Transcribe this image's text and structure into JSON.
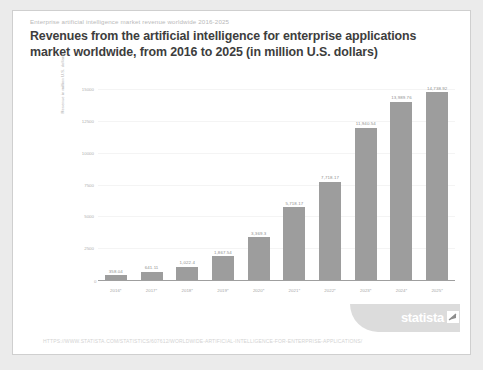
{
  "header": {
    "eyebrow": "Enterprise artificial intelligence market revenue worldwide 2016-2025",
    "title": "Revenues from the artificial intelligence for enterprise applications market worldwide, from 2016 to 2025 (in million U.S. dollars)"
  },
  "footer": {
    "url": "HTTPS://WWW.STATISTA.COM/STATISTICS/607612/WORLDWIDE-ARTIFICIAL-INTELLIGENCE-FOR-ENTERPRISE-APPLICATIONS/",
    "brand": "statista"
  },
  "colors": {
    "bar": "#9d9d9d",
    "card": "#ffffff",
    "page": "#ebebeb",
    "axis": "#9f9f9f",
    "grid": "#f4f4f4",
    "title_text": "#3d3d3d",
    "muted_text": "#b0b0b0"
  },
  "chart_data": {
    "type": "bar",
    "title": "Revenues from the artificial intelligence for enterprise applications market worldwide, from 2016 to 2025 (in million U.S. dollars)",
    "xlabel": "",
    "ylabel": "Revenue in million U.S. dollars",
    "categories": [
      "2016*",
      "2017*",
      "2018*",
      "2019*",
      "2020*",
      "2021*",
      "2022*",
      "2023*",
      "2024*",
      "2025*"
    ],
    "values": [
      358.04,
      641.11,
      1022.4,
      1867.54,
      3369.3,
      5718.17,
      7718.17,
      11940.54,
      13989.76,
      14738.92
    ],
    "value_labels": [
      "358.04",
      "641.11",
      "1,022.4",
      "1,867.54",
      "3,369.3",
      "5,718.17",
      "7,718.17",
      "11,940.54",
      "13,989.76",
      "14,738.92"
    ],
    "ylim": [
      0,
      15000
    ],
    "yticks": [
      0,
      2500,
      5000,
      7500,
      10000,
      12500,
      15000
    ],
    "ytick_labels": [
      "0",
      "2500",
      "5000",
      "7500",
      "10000",
      "12500",
      "15000"
    ],
    "grid": true,
    "legend": "none"
  }
}
